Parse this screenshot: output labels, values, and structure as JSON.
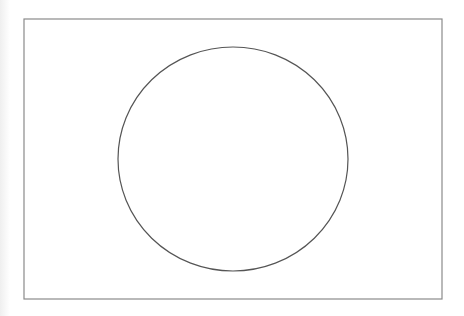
{
  "diagram": {
    "frame": {
      "x": 24,
      "y": 19,
      "width": 418,
      "height": 280,
      "stroke": "#8a8a8a",
      "stroke_width": 1.2
    },
    "shape": {
      "type": "ellipse",
      "cx": 233,
      "cy": 159,
      "rx": 115,
      "ry": 112,
      "stroke": "#555555",
      "stroke_width": 1.2,
      "fill": "none"
    },
    "background": "#ffffff"
  }
}
